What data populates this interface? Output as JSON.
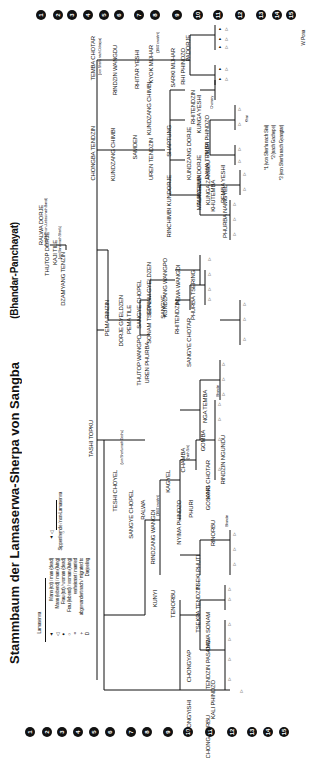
{
  "title": {
    "main": "Stammbaum der Lamaserwa-Sherpa von Sangba",
    "sub": "(Bhandar-Panchayat)"
  },
  "author": "W. Pona",
  "generations": [
    "1",
    "2",
    "3",
    "4",
    "5",
    "6",
    "7",
    "8",
    "9",
    "10",
    "11",
    "12",
    "13",
    "14",
    "15"
  ],
  "legend": {
    "group_lamaserwa": "Lamaserwa",
    "group_non_lamaserwa": "Sippenfremde / non-Lamaserwa",
    "items": [
      {
        "symbol": "▲",
        "label": "Mann (tot) / man (dead)"
      },
      {
        "symbol": "△",
        "label": "Mann (lebend) / man (living)"
      },
      {
        "symbol": "●",
        "label": "Frau (tot) / woman (dead)"
      },
      {
        "symbol": "○",
        "label": "Frau (lebend) / woman (living)"
      },
      {
        "symbol": "=",
        "label": "verheiratet / married"
      },
      {
        "symbol": "+",
        "label": "abgewandert nach / migrated to"
      },
      {
        "symbol": "D",
        "label": "Darjeeling"
      }
    ]
  },
  "footnotes": [
    "*1 (von Sherfu nach Sini)",
    "*2 (nach Gachepe)",
    "*3 (von Sherfu nach Gyangtar)"
  ],
  "people": {
    "ralwa_dorje": "RALWA DORJE",
    "ralwa_note": "(um 1840 von Junbesi nach Bandi)",
    "thutop_dorje": "THUTOP DORJE",
    "kaji_tile": "KAJI TILE",
    "kaji_note": "(von Bandi nach Sherfu)",
    "dzamyang_tenzin": "DZAMYANG TENZIN",
    "tashi_topku": "TASHI TOPKU",
    "pema_rinzin": "PEMA RINZIN",
    "dorje_gyeldzen": "DORJE GYELDZEN",
    "pema_tile": "PEMA TILE",
    "thutop_wangpo": "THUTOP WANGPO",
    "uren_phurba": "UREN PHURBA",
    "sangye_chopel": "SANGYE CHOPEL",
    "sonam_tsepal": "SONAM TSEPAL",
    "sonam_gyeldzen": "SONAM GYELDZEN",
    "sangye": "SANGYE",
    "kundzang_wangpo": "KUNDZANG WANGPO",
    "rhitendzin": "RHITENDZIN",
    "pema_wangdi": "PEMA WANGDI",
    "sangye_chotar": "SANGYE CHOTAR",
    "phurba_tsering": "PHURBA TSERING",
    "tembu_chotar": "TEMBA CHOTAR",
    "tembu_note": "(von Sherfu nach Dokarpa)",
    "chongba_tendzin": "CHONGBA TENDZIN",
    "rindzin_wangdu": "RINDZIN WANGDU",
    "rhitar_yeshi": "RHITAR YESHI",
    "kyok_mijhar": "KYOK MIJHAR",
    "kyok_note": "(1847 erwähnt)",
    "sarki_mijhar": "SARKI MIJHAR",
    "rhi_phindzo": "RHI PHINDZO",
    "padorje": "PADORJE",
    "kundzang_chimbi": "KUNDZANG CHIMBI",
    "samden": "SAMDEN",
    "uren_tendzin": "UREN TENDZIN",
    "rinchimbi_kundorje": "RINCHIMBI KUNDORJE",
    "shaptung": "SHAPTUNG",
    "kundzang_chimbi2": "KUNDZANG CHIMBI",
    "rhitendzin2": "RHITENDZIN",
    "kunga_yeshi": "KUNGA YESHI",
    "tarchimbi": "TARCHIMBI",
    "malkyelma_dorje": "MALKYELMA DORJE",
    "kundzang_dorje": "KUNDZANG DORJE",
    "nuri_phindzo": "NURI PHINDZO",
    "dawa_temba": "DAWA TEMBA",
    "kunga_zangbu": "KUNGA ZANGBU",
    "khutemba": "KHUTEMBA",
    "pemba_yeshi": "PEMBA YESHI",
    "phurba_namgyel": "PHURBA NAMGYEL",
    "teshi_choyel": "TESHI CHOYEL",
    "teshi_note": "(von Sherfu nach Gechu)",
    "sangye_chopel2": "SANGYE CHOPEL",
    "ralwa": "RALWA",
    "rindzang_wangdi": "RINDZANG WANGDI",
    "rindzang_note": "(1847 erwähnt)",
    "kunyi": "KUNYI",
    "kagyel": "KAGYEL",
    "nyima_phindzo": "NYIMA PHINDZO",
    "phuri": "PHURI",
    "chamba": "CHAMBA",
    "chamba_note": "(nach Sini)",
    "kari": "KARI",
    "gosang_chotar": "GOSANG CHOTAR",
    "gomba": "GOMBA",
    "rindzin_ngundu": "RINDZIN NGUNDU",
    "nga_temba": "NGA TEMBA",
    "rinorbu": "RINORBU",
    "tenorbu": "TENORBU",
    "tsekpa_tendzin": "TSEKPA TENDZIN",
    "tseki_phuti": "TSEKI PHUTI",
    "chongyap": "CHONGYAP",
    "tendzin_pasang": "TENDZIN PASANG",
    "dawa_sonam": "DAWA SONAM",
    "kali_phindzo": "KALI PHINDZO",
    "chongyishi": "CHONGYISHI",
    "chong_norbu": "CHONG NORBU",
    "bhandar": "Bhandar",
    "khari": "Khari",
    "chomery": "Chomery"
  }
}
